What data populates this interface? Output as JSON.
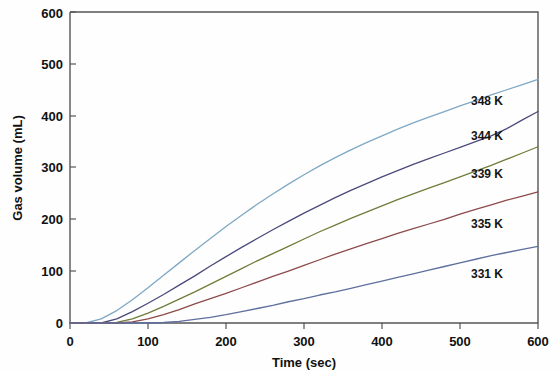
{
  "chart_data": {
    "type": "line",
    "title": "",
    "xlabel": "Time (sec)",
    "ylabel": "Gas volume (mL)",
    "xlim": [
      0,
      600
    ],
    "ylim": [
      0,
      600
    ],
    "xticks": [
      "0",
      "100",
      "200",
      "300",
      "400",
      "500",
      "600"
    ],
    "yticks": [
      "0",
      "100",
      "200",
      "300",
      "400",
      "500",
      "600"
    ],
    "xtick_values": [
      0,
      100,
      200,
      300,
      400,
      500,
      600
    ],
    "ytick_values": [
      0,
      100,
      200,
      300,
      400,
      500,
      600
    ],
    "grid": false,
    "legend_position": "inline-right",
    "x": [
      0,
      20,
      40,
      60,
      80,
      100,
      120,
      140,
      160,
      180,
      200,
      220,
      240,
      260,
      280,
      300,
      320,
      340,
      360,
      380,
      400,
      420,
      440,
      460,
      480,
      500,
      520,
      540,
      560,
      580,
      600
    ],
    "series": [
      {
        "name": "348 K",
        "label": "348 K",
        "color": "#7fa8c4",
        "induction_sec": 20,
        "final_value": 470,
        "values": [
          0,
          0,
          8,
          24,
          45,
          68,
          92,
          116,
          140,
          163,
          186,
          208,
          229,
          249,
          268,
          286,
          303,
          319,
          334,
          348,
          361,
          374,
          386,
          397,
          408,
          419,
          429,
          440,
          450,
          460,
          470
        ]
      },
      {
        "name": "344 K",
        "label": "344 K",
        "color": "#4b4a7a",
        "induction_sec": 40,
        "final_value": 408,
        "values": [
          0,
          0,
          0,
          8,
          22,
          38,
          55,
          73,
          91,
          110,
          128,
          146,
          163,
          180,
          196,
          212,
          227,
          242,
          256,
          269,
          282,
          294,
          306,
          317,
          328,
          339,
          350,
          361,
          375,
          392,
          408
        ]
      },
      {
        "name": "339 K",
        "label": "339 K",
        "color": "#6e7d3a",
        "induction_sec": 60,
        "final_value": 340,
        "values": [
          0,
          0,
          0,
          1,
          8,
          19,
          32,
          46,
          60,
          75,
          90,
          105,
          120,
          134,
          148,
          162,
          176,
          189,
          202,
          214,
          226,
          238,
          249,
          260,
          271,
          282,
          293,
          304,
          316,
          328,
          340
        ]
      },
      {
        "name": "335 K",
        "label": "335 K",
        "color": "#8c4a4a",
        "induction_sec": 80,
        "final_value": 253,
        "values": [
          0,
          0,
          0,
          0,
          2,
          8,
          16,
          26,
          37,
          47,
          57,
          68,
          79,
          90,
          100,
          111,
          122,
          133,
          143,
          153,
          163,
          173,
          182,
          191,
          200,
          210,
          219,
          228,
          237,
          245,
          253
        ]
      },
      {
        "name": "331 K",
        "label": "331 K",
        "color": "#5f6f9e",
        "induction_sec": 130,
        "final_value": 148,
        "values": [
          0,
          0,
          0,
          0,
          0,
          0,
          1,
          3,
          7,
          11,
          16,
          22,
          28,
          34,
          41,
          47,
          54,
          60,
          67,
          74,
          81,
          88,
          95,
          102,
          109,
          116,
          123,
          130,
          136,
          142,
          148
        ]
      }
    ]
  },
  "labels": {
    "x_axis_title": "Time (sec)",
    "y_axis_title": "Gas volume (mL)",
    "series_348": "348 K",
    "series_344": "344 K",
    "series_339": "339 K",
    "series_335": "335 K",
    "series_331": "331 K",
    "xtick_0": "0",
    "xtick_100": "100",
    "xtick_200": "200",
    "xtick_300": "300",
    "xtick_400": "400",
    "xtick_500": "500",
    "xtick_600": "600",
    "ytick_0": "0",
    "ytick_100": "100",
    "ytick_200": "200",
    "ytick_300": "300",
    "ytick_400": "400",
    "ytick_500": "500",
    "ytick_600": "600"
  }
}
